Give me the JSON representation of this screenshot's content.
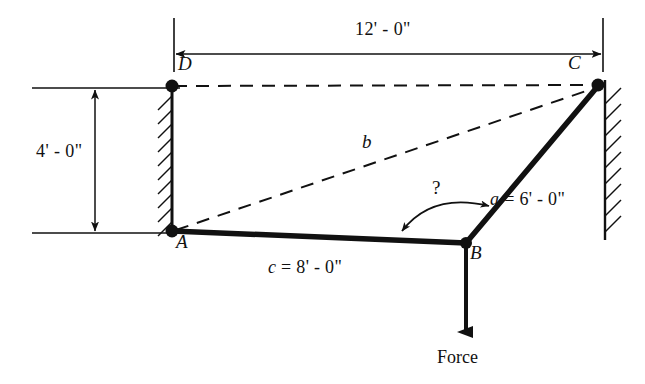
{
  "figure": {
    "background_color": "#ffffff",
    "ink_color": "#111111"
  },
  "nodes": [
    {
      "id": "A",
      "label": "A",
      "x": 172,
      "y": 231,
      "label_x": 176,
      "label_y": 238,
      "marker": "filled-dot"
    },
    {
      "id": "B",
      "label": "B",
      "x": 466,
      "y": 243,
      "label_x": 470,
      "label_y": 249,
      "marker": "filled-dot"
    },
    {
      "id": "C",
      "label": "C",
      "x": 598,
      "y": 85,
      "label_x": 570,
      "label_y": 62,
      "marker": "filled-dot"
    },
    {
      "id": "D",
      "label": "D",
      "x": 172,
      "y": 86,
      "label_x": 178,
      "label_y": 63,
      "marker": "filled-dot"
    }
  ],
  "members": [
    {
      "id": "AB",
      "from": "A",
      "to": "B",
      "style": "solid-heavy"
    },
    {
      "id": "BC",
      "from": "B",
      "to": "C",
      "style": "solid-heavy"
    }
  ],
  "construction_lines": [
    {
      "id": "DC",
      "from": "D",
      "to": "C",
      "style": "dashed"
    },
    {
      "id": "AC",
      "from": "A",
      "to": "C",
      "style": "dashed"
    }
  ],
  "walls": [
    {
      "id": "left-wall",
      "x": 172,
      "y_top": 86,
      "y_bottom": 231,
      "hatch_side": "left"
    },
    {
      "id": "right-wall",
      "x": 605,
      "y_top": 85,
      "y_bottom": 238,
      "hatch_side": "right"
    }
  ],
  "labels": {
    "span_horizontal": "12' - 0\"",
    "span_vertical": "4' - 0\"",
    "member_a": "a = 6' - 0\"",
    "member_a_var": "a",
    "member_a_value": "= 6' - 0\"",
    "member_c": "c = 8' - 0\"",
    "member_c_var": "c",
    "member_c_value": "= 8' - 0\"",
    "diagonal_b": "b",
    "angle_unknown": "?",
    "force": "Force"
  },
  "dimensions": {
    "horizontal": {
      "name": "overall-width",
      "text": "12' - 0\"",
      "line_y": 54,
      "x_start": 174,
      "x_end": 600,
      "text_x": 390,
      "text_y": 24,
      "extension_top": 18,
      "arrows": "both"
    },
    "vertical": {
      "name": "overall-height",
      "text": "4' - 0\"",
      "line_x": 95,
      "y_start": 88,
      "y_end": 233,
      "text_x": 36,
      "text_y": 152,
      "extension_left": 32,
      "extension_right_top": 172,
      "extension_right_bottom": 172,
      "arrows": "both"
    }
  },
  "force_arrow": {
    "name": "force-vector",
    "x": 466,
    "y_start": 243,
    "y_end": 338,
    "label_x": 440,
    "label_y": 352,
    "direction": "down"
  },
  "angle_marker": {
    "name": "unknown-angle-at-B",
    "vertex": "B",
    "label": "?",
    "label_x": 434,
    "label_y": 186,
    "arc_start_x": 398,
    "arc_start_y": 232,
    "arc_end_x": 492,
    "arc_end_y": 205,
    "arrows": "both"
  },
  "label_positions": {
    "member_a": {
      "x": 490,
      "y": 196
    },
    "member_c": {
      "x": 268,
      "y": 262
    },
    "diagonal_b": {
      "x": 362,
      "y": 132
    }
  }
}
